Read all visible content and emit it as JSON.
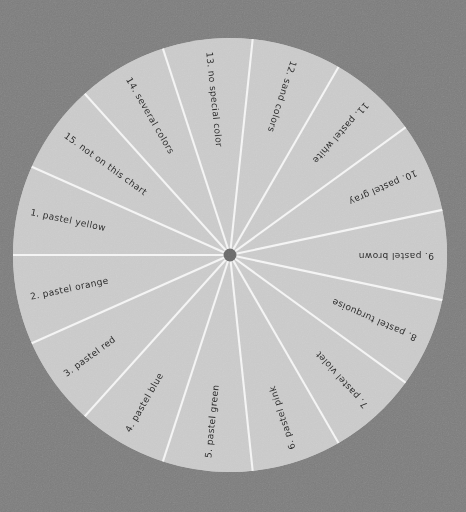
{
  "figure": {
    "background_color": "#7d7d7d",
    "disc_color": "#c9c9c9",
    "divider_color": "#f4f4f4",
    "hub_color": "#6a6a6a",
    "label_color": "#2b2b2b",
    "center_x": 230,
    "center_y": 255,
    "radius": 217,
    "hub_radius": 6.5,
    "divider_width": 2.1,
    "sector_count": 15,
    "sector_angle_degrees": 24,
    "start_angle_degrees": 0,
    "rotation_direction": "counter-clockwise"
  },
  "chart_data": {
    "type": "pie",
    "title": "",
    "subtitle": "",
    "xlabel": "",
    "ylabel": "",
    "legend_position": "none",
    "grid": false,
    "equal_slices": true,
    "slice_value": 6.6667,
    "units": "percent",
    "categories": [
      "pastel yellow",
      "pastel orange",
      "pastel red",
      "pastel blue",
      "pastel green",
      "pastel pink",
      "pastel violet",
      "pastel turquoise",
      "pastel brown",
      "pastel gray",
      "pastel white",
      "sand colors",
      "no special color",
      "several colors",
      "not on this chart"
    ],
    "values": [
      6.6667,
      6.6667,
      6.6667,
      6.6667,
      6.6667,
      6.6667,
      6.6667,
      6.6667,
      6.6667,
      6.6667,
      6.6667,
      6.6667,
      6.6667,
      6.6667,
      6.6667
    ],
    "slices": [
      {
        "index": 1,
        "number_label": "1.",
        "name": "pastel yellow",
        "full_label": "1.  pastel yellow",
        "value": 6.6667,
        "start_angle": 156,
        "end_angle": 180,
        "mid_angle": 168
      },
      {
        "index": 2,
        "number_label": "2.",
        "name": "pastel orange",
        "full_label": "2.  pastel orange",
        "value": 6.6667,
        "start_angle": 180,
        "end_angle": 204,
        "mid_angle": 192
      },
      {
        "index": 3,
        "number_label": "3.",
        "name": "pastel red",
        "full_label": "3.  pastel red",
        "value": 6.6667,
        "start_angle": 204,
        "end_angle": 228,
        "mid_angle": 216
      },
      {
        "index": 4,
        "number_label": "4.",
        "name": "pastel blue",
        "full_label": "4.  pastel blue",
        "value": 6.6667,
        "start_angle": 228,
        "end_angle": 252,
        "mid_angle": 240
      },
      {
        "index": 5,
        "number_label": "5.",
        "name": "pastel green",
        "full_label": "5.  pastel green",
        "value": 6.6667,
        "start_angle": 252,
        "end_angle": 276,
        "mid_angle": 264
      },
      {
        "index": 6,
        "number_label": "6.",
        "name": "pastel pink",
        "full_label": "6.  pastel pink",
        "value": 6.6667,
        "start_angle": 276,
        "end_angle": 300,
        "mid_angle": 288
      },
      {
        "index": 7,
        "number_label": "7.",
        "name": "pastel violet",
        "full_label": "7.  pastel violet",
        "value": 6.6667,
        "start_angle": 300,
        "end_angle": 324,
        "mid_angle": 312
      },
      {
        "index": 8,
        "number_label": "8.",
        "name": "pastel turquoise",
        "full_label": "8.  pastel turquoise",
        "value": 6.6667,
        "start_angle": 324,
        "end_angle": 348,
        "mid_angle": 336
      },
      {
        "index": 9,
        "number_label": "9.",
        "name": "pastel brown",
        "full_label": "9.  pastel brown",
        "value": 6.6667,
        "start_angle": 348,
        "end_angle": 372,
        "mid_angle": 360
      },
      {
        "index": 10,
        "number_label": "10.",
        "name": "pastel gray",
        "full_label": "10.  pastel gray",
        "value": 6.6667,
        "start_angle": 12,
        "end_angle": 36,
        "mid_angle": 24
      },
      {
        "index": 11,
        "number_label": "11.",
        "name": "pastel white",
        "full_label": "11.  pastel white",
        "value": 6.6667,
        "start_angle": 36,
        "end_angle": 60,
        "mid_angle": 48
      },
      {
        "index": 12,
        "number_label": "12.",
        "name": "sand colors",
        "full_label": "12.  sand colors",
        "value": 6.6667,
        "start_angle": 60,
        "end_angle": 84,
        "mid_angle": 72
      },
      {
        "index": 13,
        "number_label": "13.",
        "name": "no special color",
        "full_label": "13.  no special color",
        "value": 6.6667,
        "start_angle": 84,
        "end_angle": 108,
        "mid_angle": 96
      },
      {
        "index": 14,
        "number_label": "14.",
        "name": "several colors",
        "full_label": "14.  several colors",
        "value": 6.6667,
        "start_angle": 108,
        "end_angle": 132,
        "mid_angle": 120
      },
      {
        "index": 15,
        "number_label": "15.",
        "name": "not on this chart",
        "full_label": "15.  not on this chart",
        "value": 6.6667,
        "start_angle": 132,
        "end_angle": 156,
        "mid_angle": 144
      }
    ]
  }
}
